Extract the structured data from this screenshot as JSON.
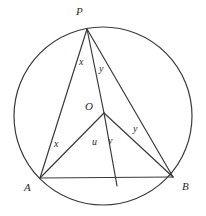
{
  "figure": {
    "type": "circle-geometry-diagram",
    "stroke_color": "#3a3a3a",
    "background_color": "#ffffff",
    "circle": {
      "center_x": 103,
      "center_y": 116,
      "radius": 89
    },
    "points": [
      {
        "id": "P",
        "label": "P",
        "x": 87,
        "y": 29,
        "label_x": 76,
        "label_y": 6
      },
      {
        "id": "O",
        "label": "O",
        "x": 104,
        "y": 113,
        "label_x": 85,
        "label_y": 101
      },
      {
        "id": "A",
        "label": "A",
        "x": 40,
        "y": 178,
        "label_x": 24,
        "label_y": 182
      },
      {
        "id": "B",
        "label": "B",
        "x": 173,
        "y": 177,
        "label_x": 182,
        "label_y": 181
      },
      {
        "id": "C",
        "label": "",
        "x": 117,
        "y": 186,
        "label_x": 0,
        "label_y": 0
      }
    ],
    "segments": [
      {
        "from": "P",
        "to": "A",
        "name": "segment-PA"
      },
      {
        "from": "P",
        "to": "O",
        "name": "segment-PO"
      },
      {
        "from": "P",
        "to": "B",
        "name": "segment-PB"
      },
      {
        "from": "O",
        "to": "A",
        "name": "segment-OA"
      },
      {
        "from": "O",
        "to": "B",
        "name": "segment-OB"
      },
      {
        "from": "O",
        "to": "C",
        "name": "segment-OC"
      },
      {
        "from": "A",
        "to": "B",
        "name": "segment-AB"
      }
    ],
    "angle_labels": [
      {
        "id": "x-at-P",
        "text": "x",
        "x": 79,
        "y": 57
      },
      {
        "id": "y-at-P",
        "text": "y",
        "x": 99,
        "y": 64
      },
      {
        "id": "x-at-A",
        "text": "x",
        "x": 54,
        "y": 139
      },
      {
        "id": "u-at-O",
        "text": "u",
        "x": 92,
        "y": 137
      },
      {
        "id": "v-at-O",
        "text": "v",
        "x": 108,
        "y": 136
      },
      {
        "id": "y-at-B",
        "text": "y",
        "x": 133,
        "y": 124
      }
    ]
  }
}
